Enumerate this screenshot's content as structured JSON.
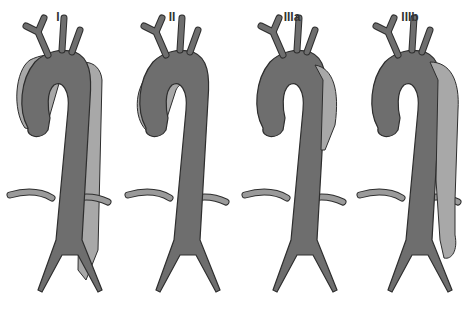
{
  "diagram": {
    "colors": {
      "true_lumen": "#6e6e6e",
      "false_lumen": "#a8a8a8",
      "outline": "#2e2e2e",
      "background": "#ffffff"
    },
    "panels": [
      {
        "label": "I",
        "false_lumen_extent": "ascending_to_iliac",
        "center_x": 58
      },
      {
        "label": "II",
        "false_lumen_extent": "ascending_only",
        "center_x": 172
      },
      {
        "label": "IIIa",
        "false_lumen_extent": "descending_thoracic",
        "center_x": 292
      },
      {
        "label": "IIIb",
        "false_lumen_extent": "descending_to_abdominal",
        "center_x": 410
      }
    ]
  }
}
